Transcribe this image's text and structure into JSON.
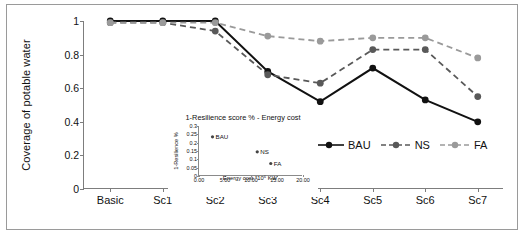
{
  "chart_data": {
    "type": "line",
    "title": "",
    "xlabel": "",
    "ylabel": "Coverage of potable water",
    "categories": [
      "Basic",
      "Sc1",
      "Sc2",
      "Sc3",
      "Sc4",
      "Sc5",
      "Sc6",
      "Sc7"
    ],
    "ylim": [
      0,
      1
    ],
    "yticks": [
      "0",
      "0.2",
      "0.4",
      "0.6",
      "0.8",
      "1"
    ],
    "grid": false,
    "legend_position": "inside-bottom-right",
    "series": [
      {
        "name": "BAU",
        "color": "#111111",
        "style": "solid",
        "marker": "circle",
        "values": [
          1.0,
          1.0,
          1.0,
          0.7,
          0.52,
          0.72,
          0.53,
          0.4
        ]
      },
      {
        "name": "NS",
        "color": "#595959",
        "style": "dashed",
        "marker": "circle",
        "values": [
          0.99,
          0.99,
          0.94,
          0.68,
          0.63,
          0.83,
          0.83,
          0.55
        ]
      },
      {
        "name": "FA",
        "color": "#9a9a9a",
        "style": "dashed",
        "marker": "circle",
        "values": [
          0.99,
          0.99,
          0.99,
          0.91,
          0.88,
          0.9,
          0.9,
          0.78
        ]
      }
    ],
    "inset": {
      "type": "scatter",
      "title": "1-Resilience score % - Energy cost",
      "xlabel": "Energy cost *10⁶ KW",
      "ylabel": "1-Resilience %",
      "xlim": [
        0,
        20
      ],
      "ylim": [
        0,
        0.3
      ],
      "xticks": [
        "0.00",
        "5.00",
        "10.00",
        "15.00",
        "20.00"
      ],
      "yticks": [
        "0",
        "0.05",
        "0.1",
        "0.15",
        "0.2",
        "0.25",
        "0.3"
      ],
      "points": [
        {
          "label": "BAU",
          "x": 2.6,
          "y": 0.235
        },
        {
          "label": "NS",
          "x": 11.2,
          "y": 0.145
        },
        {
          "label": "FA",
          "x": 13.8,
          "y": 0.075
        }
      ]
    }
  }
}
